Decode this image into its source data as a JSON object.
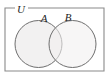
{
  "figure": {
    "type": "venn-diagram",
    "title": "",
    "universe": {
      "label": "U",
      "shape": "rectangle",
      "x": 5,
      "y": 8,
      "width": 99,
      "height": 63,
      "stroke": "#8a8a8a",
      "fill": "none",
      "label_gap": {
        "x": 15,
        "width": 13
      }
    },
    "sets": [
      {
        "label": "A",
        "shape": "circle",
        "cx": 38.5,
        "cy": 44,
        "r": 23.5,
        "fill": "#f1f0f0",
        "stroke": "#6f6f6f",
        "label_x": 44,
        "label_y": 21
      },
      {
        "label": "B",
        "shape": "circle",
        "cx": 72.5,
        "cy": 44,
        "r": 23.5,
        "fill": "#f1f0f0",
        "stroke": "#6f6f6f",
        "label_x": 64,
        "label_y": 20
      }
    ],
    "colors": {
      "background": "#ffffff",
      "circle_fill": "#f1f0f0",
      "circle_stroke": "#6f6f6f",
      "rect_stroke": "#8a8a8a",
      "label_text": "#1e1e1e"
    }
  }
}
